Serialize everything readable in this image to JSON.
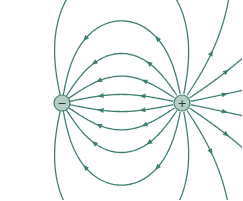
{
  "diagram": {
    "line_color": "#3f7f6f",
    "charge_fill": "#b5cdc4",
    "charges": [
      {
        "name": "negative",
        "symbol": "−",
        "cx": 62,
        "cy": 103,
        "r": 8
      },
      {
        "name": "positive",
        "symbol": "+",
        "cx": 182,
        "cy": 103,
        "r": 8
      }
    ],
    "field_line_count": 16
  }
}
